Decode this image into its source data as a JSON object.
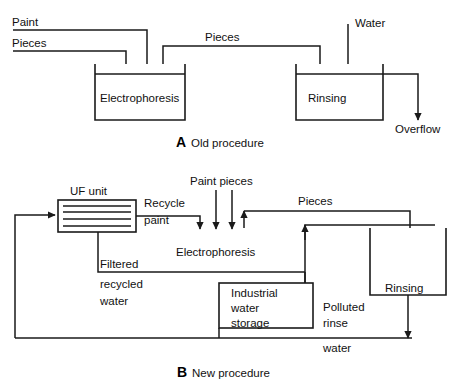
{
  "figure": {
    "background_color": "#ffffff",
    "line_color": "#1a1a1a",
    "text_color": "#111111"
  },
  "panel_a": {
    "caption_letter": "A",
    "caption_text": "Old procedure",
    "inputs": [
      {
        "label": "Paint"
      },
      {
        "label": "Pieces"
      }
    ],
    "transfer_label": "Pieces",
    "water_label": "Water",
    "overflow_label": "Overflow",
    "units": [
      {
        "name": "Electrophoresis"
      },
      {
        "name": "Rinsing"
      }
    ]
  },
  "panel_b": {
    "caption_letter": "B",
    "caption_text": "New procedure",
    "uf_unit_label": "UF unit",
    "recycle_label_line1": "Recycle",
    "recycle_label_line2": "paint",
    "paint_pieces_label": "Paint pieces",
    "pieces_label": "Pieces",
    "filtered_label_line1": "Filtered",
    "filtered_label_line2": "recycled",
    "filtered_label_line3": "water",
    "storage_label_line1": "Industrial",
    "storage_label_line2": "water",
    "storage_label_line3": "storage",
    "polluted_label_line1": "Polluted",
    "polluted_label_line2": "rinse",
    "polluted_label_line3": "water",
    "units": [
      {
        "name": "Electrophoresis"
      },
      {
        "name": "Rinsing"
      }
    ]
  }
}
